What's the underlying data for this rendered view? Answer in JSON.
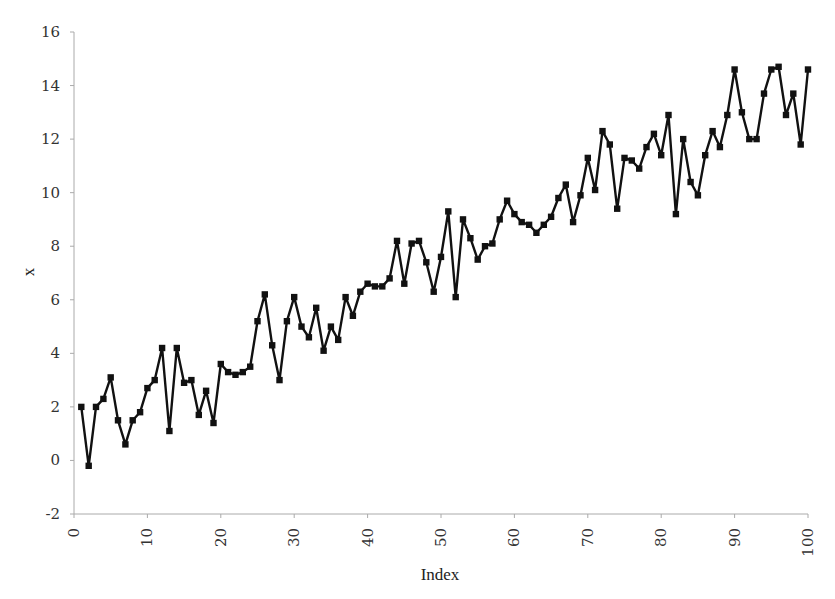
{
  "chart_data": {
    "type": "line",
    "title": "",
    "xlabel": "Index",
    "ylabel": "x",
    "xlim": [
      0,
      100
    ],
    "ylim": [
      -2,
      16
    ],
    "x_ticks": [
      0,
      10,
      20,
      30,
      40,
      50,
      60,
      70,
      80,
      90,
      100
    ],
    "y_ticks": [
      -2,
      0,
      2,
      4,
      6,
      8,
      10,
      12,
      14,
      16
    ],
    "grid": false,
    "legend": null,
    "marker": "square",
    "line_color": "#111111",
    "series": [
      {
        "name": "x",
        "x": [
          1,
          2,
          3,
          4,
          5,
          6,
          7,
          8,
          9,
          10,
          11,
          12,
          13,
          14,
          15,
          16,
          17,
          18,
          19,
          20,
          21,
          22,
          23,
          24,
          25,
          26,
          27,
          28,
          29,
          30,
          31,
          32,
          33,
          34,
          35,
          36,
          37,
          38,
          39,
          40,
          41,
          42,
          43,
          44,
          45,
          46,
          47,
          48,
          49,
          50,
          51,
          52,
          53,
          54,
          55,
          56,
          57,
          58,
          59,
          60,
          61,
          62,
          63,
          64,
          65,
          66,
          67,
          68,
          69,
          70,
          71,
          72,
          73,
          74,
          75,
          76,
          77,
          78,
          79,
          80,
          81,
          82,
          83,
          84,
          85,
          86,
          87,
          88,
          89,
          90,
          91,
          92,
          93,
          94,
          95,
          96,
          97,
          98,
          99,
          100
        ],
        "values": [
          2.0,
          -0.2,
          2.0,
          2.3,
          3.1,
          1.5,
          0.6,
          1.5,
          1.8,
          2.7,
          3.0,
          4.2,
          1.1,
          4.2,
          2.9,
          3.0,
          1.7,
          2.6,
          1.4,
          3.6,
          3.3,
          3.2,
          3.3,
          3.5,
          5.2,
          6.2,
          4.3,
          3.0,
          5.2,
          6.1,
          5.0,
          4.6,
          5.7,
          4.1,
          5.0,
          4.5,
          6.1,
          5.4,
          6.3,
          6.6,
          6.5,
          6.5,
          6.8,
          8.2,
          6.6,
          8.1,
          8.2,
          7.4,
          6.3,
          7.6,
          9.3,
          6.1,
          9.0,
          8.3,
          7.5,
          8.0,
          8.1,
          9.0,
          9.7,
          9.2,
          8.9,
          8.8,
          8.5,
          8.8,
          9.1,
          9.8,
          10.3,
          8.9,
          9.9,
          11.3,
          10.1,
          12.3,
          11.8,
          9.4,
          11.3,
          11.2,
          10.9,
          11.7,
          12.2,
          11.4,
          12.9,
          9.2,
          12.0,
          10.4,
          9.9,
          11.4,
          12.3,
          11.7,
          12.9,
          14.6,
          13.0,
          12.0,
          12.0,
          13.7,
          14.6,
          14.7,
          12.9,
          13.7,
          11.8,
          14.6
        ]
      }
    ]
  },
  "labels": {
    "xlabel": "Index",
    "ylabel": "x"
  }
}
